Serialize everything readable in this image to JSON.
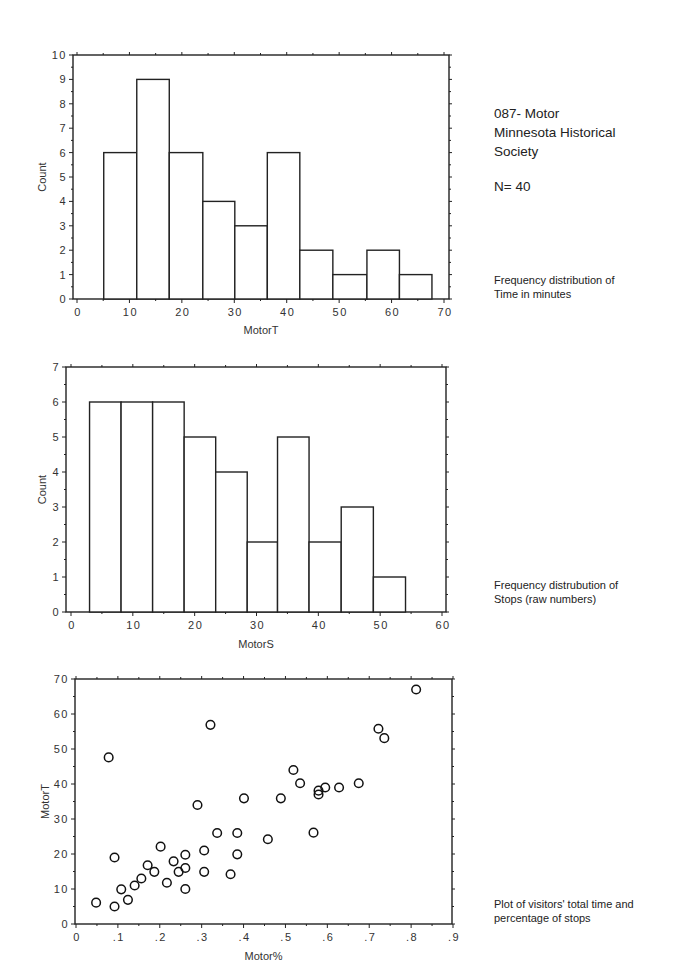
{
  "header": {
    "title_line1": "087- Motor",
    "title_line2": "Minnesota Historical",
    "title_line3": "Society",
    "n_label": "N= 40"
  },
  "captions": {
    "chart1_line1": "Frequency distribution of",
    "chart1_line2": "Time in minutes",
    "chart2_line1": "Frequency distrubution of",
    "chart2_line2": "Stops (raw numbers)",
    "chart3_line1": "Plot of visitors' total time and",
    "chart3_line2": "percentage of stops"
  },
  "chart_data": [
    {
      "type": "bar",
      "subtype": "histogram",
      "title": "Frequency distribution of Time in minutes",
      "xlabel": "MotorT",
      "ylabel": "Count",
      "xlim": [
        0,
        70
      ],
      "ylim": [
        0,
        10
      ],
      "xticks": [
        "0",
        "10",
        "20",
        "30",
        "40",
        "50",
        "60",
        "70"
      ],
      "yticks": [
        "0",
        "1",
        "2",
        "3",
        "4",
        "5",
        "6",
        "7",
        "8",
        "9",
        "10"
      ],
      "bin_edges": [
        5.1,
        11.4,
        17.6,
        24.0,
        30.1,
        36.3,
        42.5,
        48.8,
        55.3,
        61.5,
        67.7
      ],
      "values": [
        6,
        9,
        6,
        4,
        3,
        6,
        2,
        1,
        2,
        1
      ],
      "grid": false
    },
    {
      "type": "bar",
      "subtype": "histogram",
      "title": "Frequency distrubution of Stops (raw numbers)",
      "xlabel": "MotorS",
      "ylabel": "Count",
      "xlim": [
        0,
        60
      ],
      "ylim": [
        0,
        7
      ],
      "xticks": [
        "0",
        "10",
        "20",
        "30",
        "40",
        "50",
        "60"
      ],
      "yticks": [
        "0",
        "1",
        "2",
        "3",
        "4",
        "5",
        "6",
        "7"
      ],
      "bin_edges": [
        3.0,
        8.1,
        13.2,
        18.3,
        23.4,
        28.5,
        33.4,
        38.5,
        43.7,
        48.9,
        54.1
      ],
      "values": [
        6,
        6,
        6,
        5,
        4,
        2,
        5,
        2,
        3,
        1
      ],
      "grid": false
    },
    {
      "type": "scatter",
      "title": "Plot of visitors' total time and percentage of stops",
      "xlabel": "Motor%",
      "ylabel": "MotorT",
      "xlim": [
        0,
        0.9
      ],
      "ylim": [
        0,
        70
      ],
      "xticks": [
        "0",
        ".1",
        ".2",
        ".3",
        ".4",
        ".5",
        ".6",
        ".7",
        ".8",
        ".9"
      ],
      "yticks": [
        "0",
        "10",
        "20",
        "30",
        "40",
        "50",
        "60",
        "70"
      ],
      "marker": "open-circle",
      "grid": false,
      "points": [
        [
          0.048,
          6.1
        ],
        [
          0.078,
          47.6
        ],
        [
          0.092,
          19.0
        ],
        [
          0.092,
          5.0
        ],
        [
          0.108,
          9.9
        ],
        [
          0.124,
          6.9
        ],
        [
          0.14,
          11.0
        ],
        [
          0.156,
          13.0
        ],
        [
          0.171,
          16.8
        ],
        [
          0.187,
          14.9
        ],
        [
          0.202,
          22.1
        ],
        [
          0.217,
          11.8
        ],
        [
          0.233,
          17.9
        ],
        [
          0.245,
          14.9
        ],
        [
          0.261,
          19.8
        ],
        [
          0.261,
          16.0
        ],
        [
          0.261,
          10.0
        ],
        [
          0.29,
          34.0
        ],
        [
          0.306,
          21.0
        ],
        [
          0.306,
          14.9
        ],
        [
          0.321,
          56.9
        ],
        [
          0.337,
          26.0
        ],
        [
          0.369,
          14.2
        ],
        [
          0.385,
          26.0
        ],
        [
          0.385,
          19.9
        ],
        [
          0.401,
          35.9
        ],
        [
          0.458,
          24.2
        ],
        [
          0.489,
          35.9
        ],
        [
          0.519,
          44.0
        ],
        [
          0.535,
          40.2
        ],
        [
          0.567,
          26.1
        ],
        [
          0.579,
          38.1
        ],
        [
          0.579,
          37.0
        ],
        [
          0.595,
          39.0
        ],
        [
          0.628,
          39.0
        ],
        [
          0.675,
          40.2
        ],
        [
          0.722,
          55.8
        ],
        [
          0.736,
          53.1
        ],
        [
          0.812,
          67.0
        ]
      ]
    }
  ]
}
